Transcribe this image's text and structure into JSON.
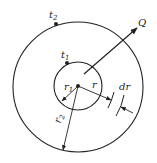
{
  "diagram": {
    "labels": {
      "outer_temp": "t",
      "outer_temp_sub": "2",
      "inner_temp": "t",
      "inner_temp_sub": "1",
      "heat_flow": "Q",
      "inner_radius": "r",
      "inner_radius_sub": "1",
      "radius": "r",
      "outer_radius": "r",
      "outer_radius_sub": "2",
      "thickness": "dr"
    },
    "colors": {
      "stroke": "#222222",
      "background": "#ffffff"
    }
  }
}
